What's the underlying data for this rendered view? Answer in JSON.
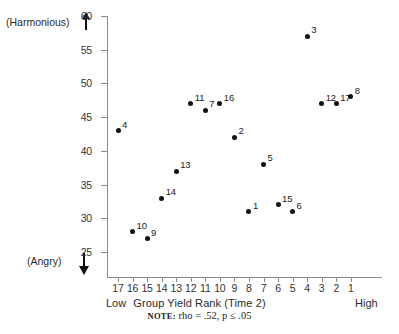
{
  "chart_data": {
    "type": "scatter",
    "title": "",
    "xlabel": "Group Yield Rank (Time 2)",
    "ylabel": "",
    "y_axis_top_anchor": "(Harmonious)",
    "y_axis_bottom_anchor": "(Angry)",
    "x_axis_left_anchor": "Low",
    "x_axis_right_anchor": "High",
    "xlim": [
      17,
      1
    ],
    "ylim": [
      22,
      60
    ],
    "x_inverted": true,
    "grid": false,
    "legend": false,
    "xticks": [
      17,
      16,
      15,
      14,
      13,
      12,
      11,
      10,
      9,
      8,
      7,
      6,
      5,
      4,
      3,
      2,
      1
    ],
    "yticks": [
      25,
      30,
      35,
      40,
      45,
      50,
      55,
      60
    ],
    "point_labels_are_group_ids": true,
    "points": [
      {
        "label": "4",
        "x": 17,
        "y": 43
      },
      {
        "label": "10",
        "x": 16,
        "y": 28
      },
      {
        "label": "9",
        "x": 15,
        "y": 27
      },
      {
        "label": "14",
        "x": 14,
        "y": 33
      },
      {
        "label": "13",
        "x": 13,
        "y": 37
      },
      {
        "label": "11",
        "x": 12,
        "y": 47
      },
      {
        "label": "7",
        "x": 11,
        "y": 46
      },
      {
        "label": "16",
        "x": 10,
        "y": 47
      },
      {
        "label": "2",
        "x": 9,
        "y": 42
      },
      {
        "label": "1",
        "x": 8,
        "y": 31
      },
      {
        "label": "5",
        "x": 7,
        "y": 38
      },
      {
        "label": "15",
        "x": 6,
        "y": 32
      },
      {
        "label": "6",
        "x": 5,
        "y": 31
      },
      {
        "label": "3",
        "x": 4,
        "y": 57
      },
      {
        "label": "12",
        "x": 3,
        "y": 47
      },
      {
        "label": "17",
        "x": 2,
        "y": 47
      },
      {
        "label": "8",
        "x": 1,
        "y": 48
      }
    ],
    "annotations": {
      "note_keyword": "NOTE:",
      "note_text": " rho = .52, p ≤ .05",
      "rho": 0.52,
      "p": "≤ .05"
    }
  },
  "colors": {
    "point": "#111111",
    "axis": "#8a8a8a",
    "text": "#1a1a1a",
    "background": "#ffffff"
  }
}
